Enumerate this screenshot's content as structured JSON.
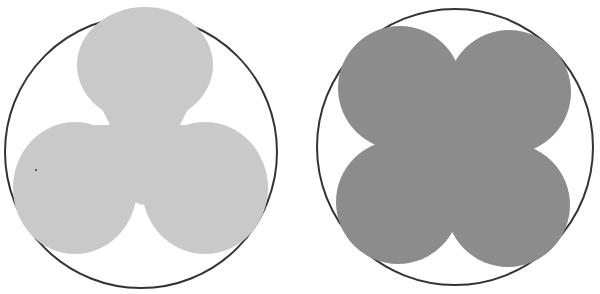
{
  "figure": {
    "panels": [
      {
        "name": "trefoil-in-circle",
        "shape": "three-lobed trefoil",
        "lobes": 3,
        "fill": "#c9c9c9",
        "outline": "#333333"
      },
      {
        "name": "quatrefoil-in-circle",
        "shape": "four-lobed quatrefoil",
        "lobes": 4,
        "fill": "#8c8c8c",
        "outline": "#333333"
      }
    ]
  }
}
